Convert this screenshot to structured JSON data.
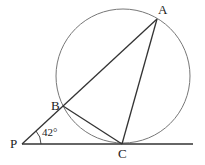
{
  "diagram": {
    "type": "geometry",
    "colors": {
      "background": "#ffffff",
      "stroke": "#333333",
      "circle": "#777777"
    },
    "circle": {
      "cx": 123,
      "cy": 76,
      "r": 67
    },
    "points": {
      "P": {
        "label": "P",
        "x": 22,
        "y": 144
      },
      "B": {
        "label": "B",
        "x": 63,
        "y": 106
      },
      "A": {
        "label": "A",
        "x": 157,
        "y": 19
      },
      "C": {
        "label": "C",
        "x": 122,
        "y": 144
      }
    },
    "segments": [
      {
        "name": "PA",
        "from": "P",
        "to": "A"
      },
      {
        "name": "PC-tangent",
        "from": "P",
        "to": "end",
        "end": {
          "x": 193,
          "y": 144
        }
      },
      {
        "name": "AC",
        "from": "A",
        "to": "C"
      },
      {
        "name": "BC",
        "from": "B",
        "to": "C"
      }
    ],
    "angle": {
      "vertex": "P",
      "label": "42°",
      "value_degrees": 42
    }
  }
}
